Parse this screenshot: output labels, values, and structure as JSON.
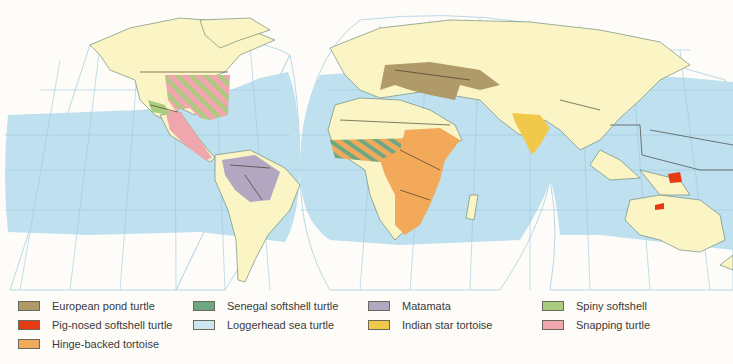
{
  "map": {
    "title": "",
    "colors": {
      "ocean_range": "#bfe0ef",
      "land": "#fbf4c4",
      "graticule": "#9cc9dc",
      "border": "#2f2a1e",
      "background": "#fdfcf8"
    }
  },
  "legend": {
    "items": [
      {
        "label": "European pond turtle",
        "color": "#b09a6a"
      },
      {
        "label": "Pig-nosed softshell turtle",
        "color": "#e63a12"
      },
      {
        "label": "Hinge-backed tortoise",
        "color": "#f2a95a"
      },
      {
        "label": "Senegal softshell turtle",
        "color": "#6da882"
      },
      {
        "label": "Loggerhead sea turtle",
        "color": "#cde7f2"
      },
      {
        "label": "Matamata",
        "color": "#b3a6c0"
      },
      {
        "label": "Indian star tortoise",
        "color": "#f0c94a"
      },
      {
        "label": "Spiny softshell",
        "color": "#a9cc7e"
      },
      {
        "label": "Snapping turtle",
        "color": "#f0a6ad"
      }
    ]
  }
}
